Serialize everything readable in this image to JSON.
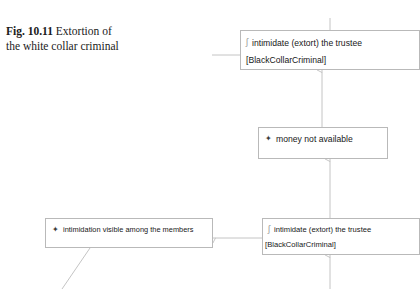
{
  "figure": {
    "number": "Fig. 10.11",
    "caption": "Extortion of the white collar criminal",
    "caption_line1": "Extortion of",
    "caption_line2": "the white collar criminal"
  },
  "diagram": {
    "type": "activity-diagram",
    "line_color": "#c4c4c4",
    "border_color": "#b9b9b9",
    "background": "#ffffff",
    "nodes": [
      {
        "id": "top",
        "label": "intimidate (extort) the trustee",
        "sublabel": "[BlackCollarCriminal]",
        "icon": "action-glyph-icon",
        "icon_char": "ʃ"
      },
      {
        "id": "mid",
        "label": "money not available",
        "icon": "signal-receive-icon",
        "icon_char": "✦"
      },
      {
        "id": "bottom-left",
        "label": "intimidation visible among the members",
        "icon": "signal-receive-icon",
        "icon_char": "✦"
      },
      {
        "id": "bottom-right",
        "label": "intimidate (extort) the trustee",
        "sublabel": "[BlackCollarCriminal]",
        "icon": "action-glyph-icon",
        "icon_char": "ʃ"
      }
    ],
    "edges": [
      {
        "id": "edge-into-top-from-above",
        "from": "above",
        "to": "top",
        "direction": "down"
      },
      {
        "id": "edge-into-top-from-left",
        "from": "left",
        "to": "top",
        "direction": "right"
      },
      {
        "id": "edge-mid-to-top",
        "from": "mid",
        "to": "top",
        "direction": "up"
      },
      {
        "id": "edge-bottom-right-to-mid",
        "from": "bottom-right",
        "to": "mid",
        "direction": "up"
      },
      {
        "id": "edge-bottom-right-to-bottom-left",
        "from": "bottom-right",
        "to": "bottom-left",
        "direction": "left"
      },
      {
        "id": "edge-below-to-bottom-right",
        "from": "below",
        "to": "bottom-right",
        "direction": "up"
      },
      {
        "id": "edge-bottom-left-diagonal",
        "from": "bottom-left",
        "to": "below-left",
        "direction": "diagonal"
      }
    ]
  }
}
